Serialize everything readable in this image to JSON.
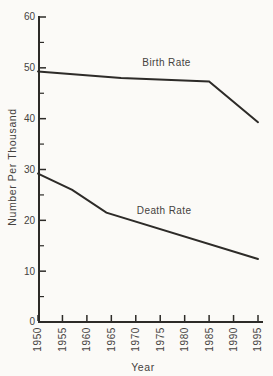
{
  "figure": {
    "background": "#fbfaf7",
    "line_color": "#2d2b28",
    "text_color": "#45423e"
  },
  "chart_data": {
    "type": "line",
    "title": "",
    "xlabel": "Year",
    "ylabel": "Number Per Thousand",
    "xlim": [
      1950,
      1995
    ],
    "ylim": [
      0,
      60
    ],
    "x_ticks": [
      1950,
      1955,
      1960,
      1965,
      1970,
      1975,
      1980,
      1985,
      1990,
      1995
    ],
    "y_ticks": [
      0,
      10,
      20,
      30,
      40,
      50,
      60
    ],
    "y_minor_ticks": [
      5,
      15,
      25,
      35,
      45,
      55
    ],
    "grid": false,
    "legend": "inline-labels",
    "series": [
      {
        "name": "Birth Rate",
        "points": [
          [
            1950,
            49.3
          ],
          [
            1967,
            48.0
          ],
          [
            1985,
            47.3
          ],
          [
            1995,
            39.3
          ]
        ],
        "label": {
          "text": "Birth Rate",
          "x": 1976.3,
          "y": 51.0
        }
      },
      {
        "name": "Death Rate",
        "points": [
          [
            1950,
            29.2
          ],
          [
            1957,
            26.0
          ],
          [
            1964,
            21.5
          ],
          [
            1995,
            12.4
          ]
        ],
        "label": {
          "text": "Death Rate",
          "x": 1975.8,
          "y": 22.0
        }
      }
    ]
  }
}
